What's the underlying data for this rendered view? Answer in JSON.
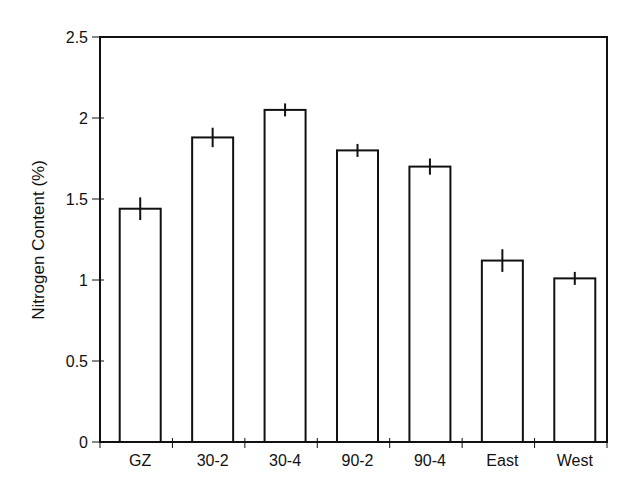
{
  "chart_data": {
    "type": "bar",
    "title": "",
    "xlabel": "",
    "ylabel": "Nitrogen Content (%)",
    "categories": [
      "GZ",
      "30-2",
      "30-4",
      "90-2",
      "90-4",
      "East",
      "West"
    ],
    "values": [
      1.44,
      1.88,
      2.05,
      1.8,
      1.7,
      1.12,
      1.01
    ],
    "error": [
      0.07,
      0.06,
      0.04,
      0.04,
      0.05,
      0.07,
      0.04
    ],
    "ylim": [
      0,
      2.5
    ],
    "yticks": [
      0,
      0.5,
      1,
      1.5,
      2,
      2.5
    ],
    "ytick_labels": [
      "0",
      "0.5",
      "1",
      "1.5",
      "2",
      "2.5"
    ],
    "grid": false,
    "legend": null,
    "bar_fill": "#ffffff",
    "bar_stroke": "#111111"
  }
}
